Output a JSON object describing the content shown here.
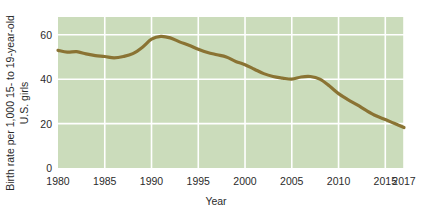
{
  "chart_data": {
    "type": "line",
    "title": "",
    "xlabel": "Year",
    "ylabel": "Birth rate per 1,000 15- to 19-year-old U.S. girls",
    "ylabel_line1": "Birth rate per 1,000 15- to 19-year-old",
    "ylabel_line2": "U.S. girls",
    "xlim": [
      1980,
      2017
    ],
    "ylim": [
      0,
      68
    ],
    "xticks": [
      1980,
      1985,
      1990,
      1995,
      2000,
      2005,
      2010,
      2015,
      2017
    ],
    "xtick_labels": [
      "1980",
      "1985",
      "1990",
      "1995",
      "2000",
      "2005",
      "2010",
      "2015",
      "2017"
    ],
    "yticks": [
      0,
      20,
      40,
      60
    ],
    "ytick_labels": [
      "0",
      "20",
      "40",
      "60"
    ],
    "grid": true,
    "grid_color": "#ffffff",
    "plot_bg_color": "#cbdcbb",
    "line_color": "#8a7333",
    "line_width": 3.2,
    "legend": null,
    "x": [
      1980,
      1981,
      1982,
      1983,
      1984,
      1985,
      1986,
      1987,
      1988,
      1989,
      1990,
      1991,
      1992,
      1993,
      1994,
      1995,
      1996,
      1997,
      1998,
      1999,
      2000,
      2001,
      2002,
      2003,
      2004,
      2005,
      2006,
      2007,
      2008,
      2009,
      2010,
      2011,
      2012,
      2013,
      2014,
      2015,
      2016,
      2017
    ],
    "values": [
      53.0,
      52.2,
      52.4,
      51.4,
      50.6,
      50.2,
      49.6,
      50.2,
      51.5,
      54.3,
      58.0,
      59.3,
      58.6,
      56.8,
      55.3,
      53.5,
      52.0,
      51.0,
      50.0,
      48.0,
      46.5,
      44.5,
      42.5,
      41.2,
      40.5,
      40.0,
      41.0,
      41.2,
      40.0,
      37.0,
      33.5,
      30.8,
      28.4,
      25.8,
      23.5,
      21.8,
      20.0,
      18.2
    ],
    "annotations": []
  }
}
